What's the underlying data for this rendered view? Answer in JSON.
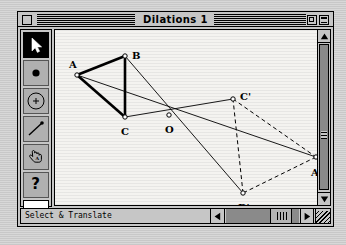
{
  "window": {
    "title": "Dilations 1",
    "close_box": "close-box",
    "zoom_box": "zoom-box",
    "collapse_box": "collapse-box"
  },
  "palette": {
    "tools": [
      {
        "name": "arrow-select-tool",
        "icon": "arrow-pointer-icon",
        "selected": true
      },
      {
        "name": "point-tool",
        "icon": "filled-dot-icon",
        "selected": false
      },
      {
        "name": "circle-tool",
        "icon": "circle-with-center-icon",
        "selected": false
      },
      {
        "name": "segment-tool",
        "icon": "line-segment-icon",
        "selected": false
      },
      {
        "name": "hand-text-tool",
        "icon": "pointing-hand-icon",
        "selected": false
      },
      {
        "name": "info-tool",
        "icon": "question-mark-icon",
        "selected": false
      }
    ]
  },
  "status": {
    "mode_label": "Select & Translate"
  },
  "scrollbars": {
    "up_arrow": "▲",
    "down_arrow": "▼",
    "left_arrow": "◀",
    "right_arrow": "▶"
  },
  "figure": {
    "width": 262,
    "height": 176,
    "points": [
      {
        "id": "A",
        "label": "A",
        "x": 22,
        "y": 45,
        "lx": 14,
        "ly": 30
      },
      {
        "id": "B",
        "label": "B",
        "x": 70,
        "y": 26,
        "lx": 77,
        "ly": 21
      },
      {
        "id": "C",
        "label": "C",
        "x": 70,
        "y": 87,
        "lx": 66,
        "ly": 97
      },
      {
        "id": "O",
        "label": "O",
        "x": 114,
        "y": 85,
        "lx": 110,
        "ly": 95
      },
      {
        "id": "Cp",
        "label": "C'",
        "x": 178,
        "y": 69,
        "lx": 185,
        "ly": 62
      },
      {
        "id": "Ap",
        "label": "A'",
        "x": 261,
        "y": 127,
        "lx": 256,
        "ly": 138
      },
      {
        "id": "Bp",
        "label": "B'",
        "x": 188,
        "y": 163,
        "lx": 183,
        "ly": 173
      }
    ],
    "solid_thick_edges": [
      [
        "A",
        "B"
      ],
      [
        "B",
        "C"
      ],
      [
        "C",
        "A"
      ]
    ],
    "dashed_edges": [
      [
        "Ap",
        "Bp"
      ],
      [
        "Bp",
        "Cp"
      ],
      [
        "Cp",
        "Ap"
      ]
    ],
    "rays": [
      [
        "A",
        "Ap"
      ],
      [
        "B",
        "Bp"
      ],
      [
        "C",
        "Cp"
      ]
    ],
    "stroke_colors": {
      "figure": "#000000",
      "canvas_background": "#f4f3f0"
    }
  }
}
